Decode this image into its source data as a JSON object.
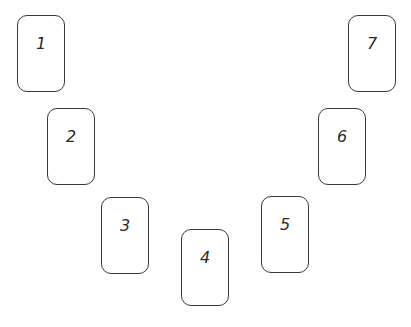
{
  "diagram": {
    "title": "",
    "cards": [
      {
        "label": "1",
        "x": 17,
        "y": 15
      },
      {
        "label": "2",
        "x": 47,
        "y": 108
      },
      {
        "label": "3",
        "x": 101,
        "y": 197
      },
      {
        "label": "4",
        "x": 181,
        "y": 229
      },
      {
        "label": "5",
        "x": 261,
        "y": 196
      },
      {
        "label": "6",
        "x": 318,
        "y": 108
      },
      {
        "label": "7",
        "x": 348,
        "y": 15
      }
    ],
    "colors": {
      "border": "#3a3a3a",
      "text": "#2a2a2a",
      "background": "#ffffff"
    }
  }
}
